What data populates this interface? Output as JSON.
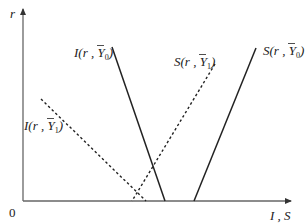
{
  "diagram": {
    "axes": {
      "y_label": "r",
      "x_label": "I , S",
      "origin_label": "0",
      "color": "#555555"
    },
    "curves": [
      {
        "id": "I_Y0",
        "name": "I",
        "args": "(r , ",
        "ybar": "Y",
        "sub": "0",
        "close": ")",
        "style": "solid",
        "color": "#222222"
      },
      {
        "id": "S_Y0",
        "name": "S",
        "args": "(r , ",
        "ybar": "Y",
        "sub": "0",
        "close": ")",
        "style": "solid",
        "color": "#222222"
      },
      {
        "id": "S_Y1",
        "name": "S",
        "args": "(r , ",
        "ybar": "Y",
        "sub": "1",
        "close": ")",
        "style": "dashed",
        "color": "#222222"
      },
      {
        "id": "I_Y1",
        "name": "I",
        "args": "(r , ",
        "ybar": "Y",
        "sub": "1",
        "close": ")",
        "style": "dashed",
        "color": "#222222"
      }
    ]
  }
}
